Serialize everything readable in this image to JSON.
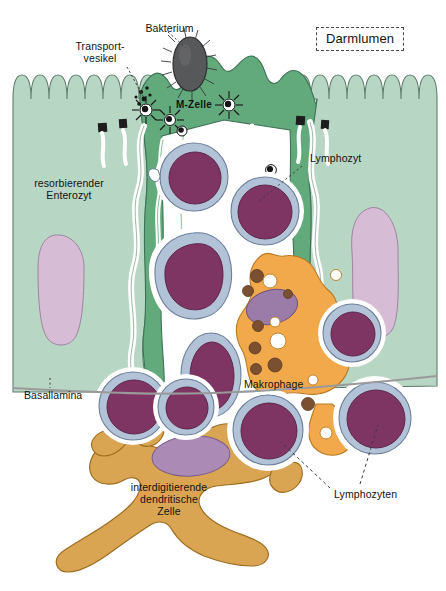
{
  "figure": {
    "width": 446,
    "height": 591,
    "background": "#ffffff"
  },
  "labels": {
    "darmlumen": "Darmlumen",
    "bakterium": "Bakterium",
    "transportvesikel_line1": "Transport-",
    "transportvesikel_line2": "vesikel",
    "m_zelle": "M-Zelle",
    "resorbierender_line1": "resorbierender",
    "resorbierender_line2": "Enterozyt",
    "lymphozyt": "Lymphozyt",
    "makrophage": "Makrophage",
    "basallamina": "Basallamina",
    "dendritisch_line1": "interdigitierende",
    "dendritisch_line2": "dendritische",
    "dendritisch_line3": "Zelle",
    "lymphozyten": "Lymphozyten"
  },
  "colors": {
    "enterocyte_fill": "#b8d6c4",
    "enterocyte_stroke": "#5f7d6c",
    "m_cell_fill": "#62a97c",
    "m_cell_stroke": "#3d7355",
    "enterocyte_nucleus": "#d6bcd4",
    "enterocyte_nucleus_stroke": "#9e84a0",
    "lymphocyte_cytoplasm": "#b2c3d8",
    "lymphocyte_stroke": "#6b7f99",
    "lymphocyte_nucleus": "#7e3563",
    "lymphocyte_nucleus_stroke": "#5d2548",
    "macrophage_fill": "#f2a94c",
    "macrophage_stroke": "#b87a22",
    "macrophage_nucleus": "#9b7ca8",
    "macrophage_granule": "#7a5030",
    "macrophage_vacuole": "#ffffff",
    "dendritic_fill": "#d9a552",
    "dendritic_stroke": "#9c6c1f",
    "dendritic_nucleus": "#ab8ab5",
    "bacterium_fill": "#57585a",
    "bacterium_stroke": "#2e2f31",
    "vesicle_fill": "#161616",
    "basal_lamina": "#9a9a9a",
    "label_text": "#121212",
    "leader_line": "#3a3a3a",
    "white_gap": "#ffffff",
    "junction": "#1d1d1d"
  },
  "elements": {
    "cells": [
      {
        "name": "resorbierender Enterozyt (links)",
        "type": "epithelial-cell"
      },
      {
        "name": "resorbierender Enterozyt (rechts)",
        "type": "epithelial-cell"
      },
      {
        "name": "M-Zelle",
        "type": "m-cell"
      },
      {
        "name": "Makrophage",
        "type": "macrophage"
      },
      {
        "name": "interdigitierende dendritische Zelle",
        "type": "dendritic-cell"
      }
    ],
    "lymphocyte_count": 9,
    "transport_vesicle_count": 5,
    "junction_count": 4
  },
  "leaders": {
    "bakterium": "dotted",
    "transportvesikel": "dotted",
    "lymphozyt": "dotted",
    "basallamina": "dotted",
    "lymphozyten": "dashed-two-branch"
  }
}
